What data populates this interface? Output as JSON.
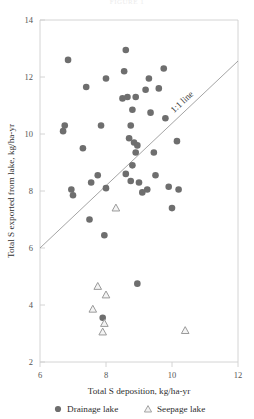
{
  "figure": {
    "top_caption": "FIGURE 1",
    "annotation": "1:1 line"
  },
  "chart_data": {
    "type": "scatter",
    "title": "",
    "xlabel": "Total S deposition, kg/ha-yr",
    "ylabel": "Total S exported from lake, kg/ha-yr",
    "xlim": [
      6,
      12
    ],
    "ylim": [
      2,
      14
    ],
    "xticks": [
      6,
      8,
      10,
      12
    ],
    "yticks": [
      2,
      4,
      6,
      8,
      10,
      12,
      14
    ],
    "grid": false,
    "legend_position": "below-axis",
    "reference_line": {
      "label": "1:1 line",
      "type": "identity",
      "x": [
        6,
        12
      ],
      "y": [
        6,
        12
      ]
    },
    "series": [
      {
        "name": "Drainage lake",
        "marker": "filled-circle",
        "color": "#6e6e6e",
        "points": [
          [
            6.85,
            12.6
          ],
          [
            6.75,
            10.3
          ],
          [
            6.7,
            10.1
          ],
          [
            6.95,
            8.05
          ],
          [
            7.0,
            7.85
          ],
          [
            7.4,
            11.65
          ],
          [
            7.3,
            9.5
          ],
          [
            7.55,
            8.3
          ],
          [
            7.5,
            7.0
          ],
          [
            8.0,
            11.95
          ],
          [
            7.85,
            10.3
          ],
          [
            7.75,
            8.55
          ],
          [
            8.0,
            8.1
          ],
          [
            7.95,
            6.45
          ],
          [
            7.9,
            3.55
          ],
          [
            8.6,
            12.95
          ],
          [
            8.55,
            12.2
          ],
          [
            8.5,
            11.25
          ],
          [
            8.65,
            11.3
          ],
          [
            8.9,
            11.3
          ],
          [
            8.8,
            10.85
          ],
          [
            8.75,
            10.3
          ],
          [
            8.7,
            9.85
          ],
          [
            8.85,
            9.7
          ],
          [
            8.95,
            9.6
          ],
          [
            8.9,
            9.35
          ],
          [
            8.8,
            8.9
          ],
          [
            8.6,
            8.6
          ],
          [
            8.75,
            8.35
          ],
          [
            9.0,
            8.3
          ],
          [
            9.1,
            7.95
          ],
          [
            8.95,
            4.75
          ],
          [
            9.3,
            11.95
          ],
          [
            9.2,
            11.55
          ],
          [
            9.35,
            10.75
          ],
          [
            9.45,
            9.35
          ],
          [
            9.25,
            8.05
          ],
          [
            9.5,
            8.55
          ],
          [
            9.6,
            11.6
          ],
          [
            9.75,
            12.3
          ],
          [
            9.8,
            10.55
          ],
          [
            9.9,
            8.15
          ],
          [
            10.0,
            7.4
          ],
          [
            10.15,
            9.75
          ],
          [
            10.2,
            8.05
          ]
        ]
      },
      {
        "name": "Seepage lake",
        "marker": "open-triangle",
        "color": "#9a9a9a",
        "points": [
          [
            8.3,
            7.4
          ],
          [
            7.75,
            4.65
          ],
          [
            8.0,
            4.35
          ],
          [
            7.6,
            3.85
          ],
          [
            7.95,
            3.35
          ],
          [
            7.9,
            3.05
          ],
          [
            10.4,
            3.1
          ]
        ]
      }
    ]
  },
  "legend": {
    "items": [
      {
        "label": "Drainage lake",
        "marker": "filled-circle"
      },
      {
        "label": "Seepage lake",
        "marker": "open-triangle"
      }
    ]
  }
}
